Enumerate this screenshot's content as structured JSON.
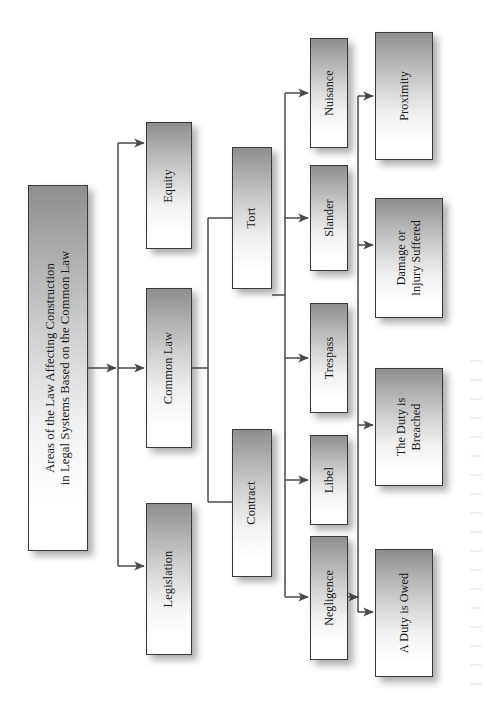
{
  "diagram": {
    "title": "Areas of the Law Affecting Construction in Legal Systems Based on the Common Law",
    "orientation": "rotated-90-ccw",
    "root": {
      "id": "root",
      "label": "Areas of the Law Affecting Construction\nin Legal Systems Based on the Common Law"
    },
    "level2": [
      {
        "id": "equity",
        "label": "Equity"
      },
      {
        "id": "common-law",
        "label": "Common Law"
      },
      {
        "id": "legislation",
        "label": "Legislation"
      }
    ],
    "level3": [
      {
        "id": "tort",
        "label": "Tort"
      },
      {
        "id": "contract",
        "label": "Contract"
      }
    ],
    "level4": [
      {
        "id": "nuisance",
        "label": "Nuisance"
      },
      {
        "id": "slander",
        "label": "Slander"
      },
      {
        "id": "trespass",
        "label": "Trespass"
      },
      {
        "id": "libel",
        "label": "Libel"
      },
      {
        "id": "negligence",
        "label": "Negligence"
      }
    ],
    "level5": [
      {
        "id": "proximity",
        "label": "Proximity"
      },
      {
        "id": "damage-or-injury",
        "label": "Damage or\nInjury Suffered"
      },
      {
        "id": "duty-breached",
        "label": "The Duty is\nBreached"
      },
      {
        "id": "duty-owed",
        "label": "A Duty is Owed"
      }
    ],
    "edges": [
      {
        "from": "root",
        "to": "equity",
        "arrow": true
      },
      {
        "from": "root",
        "to": "common-law",
        "arrow": true
      },
      {
        "from": "root",
        "to": "legislation",
        "arrow": true
      },
      {
        "from": "common-law",
        "to": "tort",
        "arrow": false
      },
      {
        "from": "common-law",
        "to": "contract",
        "arrow": false
      },
      {
        "from": "tort",
        "to": "nuisance",
        "arrow": true
      },
      {
        "from": "tort",
        "to": "slander",
        "arrow": true
      },
      {
        "from": "tort",
        "to": "trespass",
        "arrow": true
      },
      {
        "from": "tort",
        "to": "libel",
        "arrow": true
      },
      {
        "from": "tort",
        "to": "negligence",
        "arrow": true
      },
      {
        "from": "negligence",
        "to": "proximity",
        "arrow": true
      },
      {
        "from": "negligence",
        "to": "damage-or-injury",
        "arrow": true
      },
      {
        "from": "negligence",
        "to": "duty-breached",
        "arrow": true
      },
      {
        "from": "negligence",
        "to": "duty-owed",
        "arrow": true
      }
    ],
    "colors": {
      "box_border": "#3a3a3a",
      "box_fill_dark": "#8e8e8e",
      "box_fill_light": "#ffffff",
      "connector": "#4a4a4a",
      "shadow": "rgba(60,60,60,0.42)",
      "background": "#ffffff",
      "text": "#1a1a1a"
    }
  }
}
